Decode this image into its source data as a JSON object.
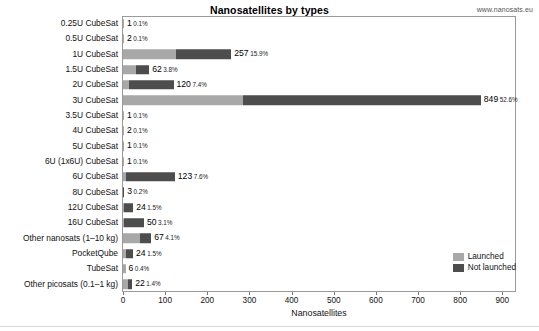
{
  "header": {
    "title": "Nanosatellites by types",
    "source": "www.nanosats.eu"
  },
  "legend": {
    "position": "bottom-right",
    "items": [
      {
        "label": "Launched",
        "color": "#a8a8a8",
        "key": "launched"
      },
      {
        "label": "Not launched",
        "color": "#4d4d4d",
        "key": "not_launched"
      }
    ]
  },
  "axis": {
    "xlabel": "Nanosatellites",
    "ylabel": "",
    "xticks": [
      0,
      100,
      200,
      300,
      400,
      500,
      600,
      700,
      800,
      900
    ],
    "xlim": [
      0,
      930
    ],
    "grid": false
  },
  "chart_data": {
    "type": "bar",
    "orientation": "horizontal",
    "stacked": true,
    "title": "Nanosatellites by types",
    "xlabel": "Nanosatellites",
    "ylabel": "",
    "xlim": [
      0,
      930
    ],
    "xticks": [
      0,
      100,
      200,
      300,
      400,
      500,
      600,
      700,
      800,
      900
    ],
    "grid": false,
    "legend_position": "bottom-right",
    "categories": [
      "0.25U CubeSat",
      "0.5U CubeSat",
      "1U CubeSat",
      "1.5U CubeSat",
      "2U CubeSat",
      "3U CubeSat",
      "3.5U CubeSat",
      "4U CubeSat",
      "5U CubeSat",
      "6U (1x6U) CubeSat",
      "6U CubeSat",
      "8U CubeSat",
      "12U CubeSat",
      "16U CubeSat",
      "Other nanosats (1–10 kg)",
      "PocketQube",
      "TubeSat",
      "Other picosats (0.1–1 kg)"
    ],
    "series": [
      {
        "name": "Launched",
        "color": "#a8a8a8",
        "values": [
          1,
          2,
          126,
          30,
          14,
          285,
          1,
          2,
          1,
          1,
          6,
          0,
          2,
          3,
          40,
          8,
          6,
          13
        ]
      },
      {
        "name": "Not launched",
        "color": "#4d4d4d",
        "values": [
          0,
          0,
          131,
          32,
          106,
          564,
          0,
          0,
          0,
          0,
          117,
          3,
          22,
          47,
          27,
          16,
          0,
          9
        ]
      }
    ],
    "totals": [
      1,
      2,
      257,
      62,
      120,
      849,
      1,
      2,
      1,
      1,
      123,
      3,
      24,
      50,
      67,
      24,
      6,
      22
    ],
    "percents": [
      "0.1%",
      "0.1%",
      "15.9%",
      "3.8%",
      "7.4%",
      "52.6%",
      "0.1%",
      "0.1%",
      "0.1%",
      "0.1%",
      "7.6%",
      "0.2%",
      "1.5%",
      "3.1%",
      "4.1%",
      "1.5%",
      "0.4%",
      "1.4%"
    ],
    "rows": [
      {
        "label": "0.25U CubeSat",
        "launched": 1,
        "not_launched": 0,
        "total": 1,
        "total_text": "1",
        "pct_text": "0.1%"
      },
      {
        "label": "0.5U CubeSat",
        "launched": 2,
        "not_launched": 0,
        "total": 2,
        "total_text": "2",
        "pct_text": "0.1%"
      },
      {
        "label": "1U CubeSat",
        "launched": 126,
        "not_launched": 131,
        "total": 257,
        "total_text": "257",
        "pct_text": "15.9%"
      },
      {
        "label": "1.5U CubeSat",
        "launched": 30,
        "not_launched": 32,
        "total": 62,
        "total_text": "62",
        "pct_text": "3.8%"
      },
      {
        "label": "2U CubeSat",
        "launched": 14,
        "not_launched": 106,
        "total": 120,
        "total_text": "120",
        "pct_text": "7.4%"
      },
      {
        "label": "3U CubeSat",
        "launched": 285,
        "not_launched": 564,
        "total": 849,
        "total_text": "849",
        "pct_text": "52.6%"
      },
      {
        "label": "3.5U CubeSat",
        "launched": 1,
        "not_launched": 0,
        "total": 1,
        "total_text": "1",
        "pct_text": "0.1%"
      },
      {
        "label": "4U CubeSat",
        "launched": 2,
        "not_launched": 0,
        "total": 2,
        "total_text": "2",
        "pct_text": "0.1%"
      },
      {
        "label": "5U CubeSat",
        "launched": 1,
        "not_launched": 0,
        "total": 1,
        "total_text": "1",
        "pct_text": "0.1%"
      },
      {
        "label": "6U (1x6U) CubeSat",
        "launched": 1,
        "not_launched": 0,
        "total": 1,
        "total_text": "1",
        "pct_text": "0.1%"
      },
      {
        "label": "6U CubeSat",
        "launched": 6,
        "not_launched": 117,
        "total": 123,
        "total_text": "123",
        "pct_text": "7.6%"
      },
      {
        "label": "8U CubeSat",
        "launched": 0,
        "not_launched": 3,
        "total": 3,
        "total_text": "3",
        "pct_text": "0.2%"
      },
      {
        "label": "12U CubeSat",
        "launched": 2,
        "not_launched": 22,
        "total": 24,
        "total_text": "24",
        "pct_text": "1.5%"
      },
      {
        "label": "16U CubeSat",
        "launched": 3,
        "not_launched": 47,
        "total": 50,
        "total_text": "50",
        "pct_text": "3.1%"
      },
      {
        "label": "Other nanosats (1–10 kg)",
        "launched": 40,
        "not_launched": 27,
        "total": 67,
        "total_text": "67",
        "pct_text": "4.1%"
      },
      {
        "label": "PocketQube",
        "launched": 8,
        "not_launched": 16,
        "total": 24,
        "total_text": "24",
        "pct_text": "1.5%"
      },
      {
        "label": "TubeSat",
        "launched": 6,
        "not_launched": 0,
        "total": 6,
        "total_text": "6",
        "pct_text": "0.4%"
      },
      {
        "label": "Other picosats (0.1–1 kg)",
        "launched": 13,
        "not_launched": 9,
        "total": 22,
        "total_text": "22",
        "pct_text": "1.4%"
      }
    ]
  }
}
